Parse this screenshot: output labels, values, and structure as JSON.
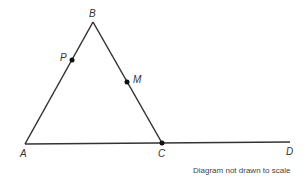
{
  "diagram": {
    "points": {
      "A": {
        "label": "A",
        "x": 25,
        "y": 144
      },
      "B": {
        "label": "B",
        "x": 93,
        "y": 22
      },
      "C": {
        "label": "C",
        "x": 162,
        "y": 143
      },
      "D": {
        "label": "D",
        "x": 290,
        "y": 142
      },
      "P": {
        "label": "P",
        "x": 72,
        "y": 60
      },
      "M": {
        "label": "M",
        "x": 127,
        "y": 82
      }
    },
    "segments": [
      "AB",
      "BC",
      "AD"
    ],
    "marked_points": [
      "P",
      "M",
      "C"
    ],
    "note": "Diagram not drawn to scale",
    "line_color": "#333333"
  }
}
